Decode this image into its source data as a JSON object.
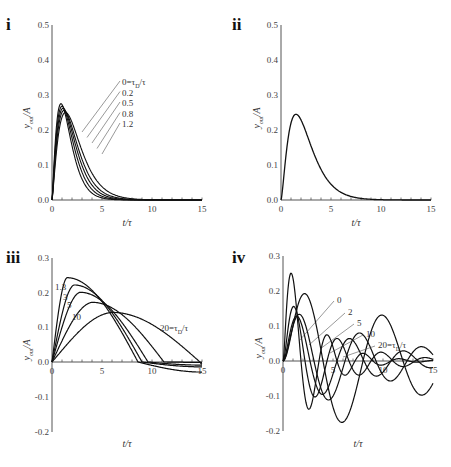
{
  "chart_data": [
    {
      "panel": "i",
      "type": "line",
      "title": "",
      "xlabel": "t/τ",
      "ylabel": "y_out/A",
      "xlim": [
        0,
        15
      ],
      "ylim": [
        0.0,
        0.5
      ],
      "xticks": [
        "0",
        "5",
        "10",
        "15"
      ],
      "yticks": [
        "0.0",
        "0.1",
        "0.2",
        "0.3",
        "0.4",
        "0.5"
      ],
      "grid": false,
      "annotation": "τ_D/τ",
      "series": [
        {
          "name": "0=τ_D/τ",
          "peak_x": 0.9,
          "peak_y": 0.275
        },
        {
          "name": "0.2",
          "peak_x": 1.0,
          "peak_y": 0.268
        },
        {
          "name": "0.5",
          "peak_x": 1.1,
          "peak_y": 0.262
        },
        {
          "name": "0.8",
          "peak_x": 1.2,
          "peak_y": 0.256
        },
        {
          "name": "1.2",
          "peak_x": 1.35,
          "peak_y": 0.25
        }
      ],
      "legend_labels": [
        "0=τ_D/τ",
        "0.2",
        "0.5",
        "0.8",
        "1.2"
      ]
    },
    {
      "panel": "ii",
      "type": "line",
      "xlabel": "t/τ",
      "ylabel": "y_out/A",
      "xlim": [
        0,
        15
      ],
      "ylim": [
        0.0,
        0.5
      ],
      "xticks": [
        "0",
        "5",
        "10",
        "15"
      ],
      "yticks": [
        "0.0",
        "0.1",
        "0.2",
        "0.3",
        "0.4",
        "0.5"
      ],
      "grid": false,
      "series": [
        {
          "name": "response",
          "peak_x": 1.5,
          "peak_y": 0.245
        }
      ]
    },
    {
      "panel": "iii",
      "type": "line",
      "xlabel": "t/τ",
      "ylabel": "y_out/A",
      "xlim": [
        0,
        15
      ],
      "ylim": [
        -0.2,
        0.3
      ],
      "xticks": [
        "0",
        "5",
        "10",
        "15"
      ],
      "yticks": [
        "-0.2",
        "-0.1",
        "0.0",
        "0.1",
        "0.2",
        "0.3"
      ],
      "grid": false,
      "series": [
        {
          "name": "1.3",
          "peak_x": 1.5,
          "peak_y": 0.243,
          "end_y": -0.03
        },
        {
          "name": "3",
          "peak_x": 2.2,
          "peak_y": 0.222,
          "end_y": -0.015
        },
        {
          "name": "5",
          "peak_x": 2.8,
          "peak_y": 0.201,
          "end_y": -0.01
        },
        {
          "name": "10",
          "peak_x": 4.0,
          "peak_y": 0.172,
          "end_y": 0.0
        },
        {
          "name": "20=τ_D/τ",
          "peak_x": 6.0,
          "peak_y": 0.143,
          "end_y": 0.005
        }
      ],
      "legend_labels": [
        "1.3",
        "3",
        "5",
        "10",
        "20=τ_D/τ"
      ]
    },
    {
      "panel": "iv",
      "type": "line",
      "xlabel": "t/τ",
      "ylabel": "y_out/A",
      "xlim": [
        0,
        15
      ],
      "ylim": [
        -0.2,
        0.3
      ],
      "xticks": [
        "0",
        "5",
        "10",
        "15"
      ],
      "yticks": [
        "-0.2",
        "-0.1",
        "0.0",
        "0.1",
        "0.2",
        "0.3"
      ],
      "grid": false,
      "series": [
        {
          "name": "0",
          "peak_x": 0.5,
          "peak_y": 0.21,
          "min_y": -0.045
        },
        {
          "name": "2",
          "peak_x": 1.0,
          "peak_y": 0.158,
          "min_y": -0.045
        },
        {
          "name": "5",
          "peak_x": 1.6,
          "peak_y": 0.125,
          "min_y": -0.045
        },
        {
          "name": "10",
          "peak_x": 2.3,
          "peak_y": 0.1,
          "min_y": -0.045
        },
        {
          "name": "20=τ_D/τ",
          "peak_x": 3.5,
          "peak_y": 0.078,
          "min_y": -0.045
        }
      ],
      "legend_labels": [
        "0",
        "2",
        "5",
        "10",
        "20=τ_D/τ"
      ]
    }
  ],
  "panels": {
    "i": {
      "label": "i",
      "xlabel": "t/τ",
      "ylabel_main": "y",
      "ylabel_sub": "out",
      "ylabel_tail": "/A",
      "ann": [
        "0=τ",
        "0.2",
        "0.5",
        "0.8",
        "1.2"
      ],
      "ann_sub": "D",
      "ann_tail": "/τ"
    },
    "ii": {
      "label": "ii",
      "xlabel": "t/τ",
      "ylabel_main": "y",
      "ylabel_sub": "out",
      "ylabel_tail": "/A"
    },
    "iii": {
      "label": "iii",
      "xlabel": "t/τ",
      "ylabel_main": "y",
      "ylabel_sub": "out",
      "ylabel_tail": "/A",
      "ann": [
        "1.3",
        "3",
        "5",
        "10",
        "20=τ"
      ],
      "ann_sub": "D",
      "ann_tail": "/τ"
    },
    "iv": {
      "label": "iv",
      "xlabel": "t/τ",
      "ylabel_main": "y",
      "ylabel_sub": "out",
      "ylabel_tail": "/A",
      "ann": [
        "0",
        "2",
        "5",
        "10",
        "20=τ"
      ],
      "ann_sub": "D",
      "ann_tail": "/τ"
    }
  },
  "ticks": {
    "x": [
      "0",
      "5",
      "10",
      "15"
    ],
    "y_top": [
      "0.0",
      "0.1",
      "0.2",
      "0.3",
      "0.4",
      "0.5"
    ],
    "y_bottom": [
      "-0.2",
      "-0.1",
      "0.0",
      "0.1",
      "0.2",
      "0.3"
    ]
  }
}
